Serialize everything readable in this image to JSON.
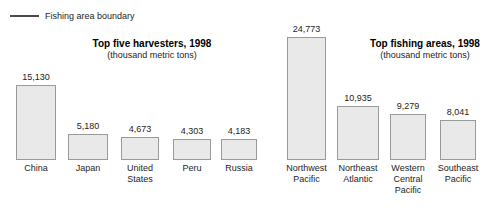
{
  "legend": {
    "icon": "horizontal-line-swatch",
    "label": "Fishing area boundary"
  },
  "panels": [
    {
      "id": "top-five-harvesters",
      "title": "Top five harvesters, 1998",
      "subtitle": "(thousand metric tons)"
    },
    {
      "id": "top-fishing-areas",
      "title": "Top fishing areas, 1998",
      "subtitle": "(thousand metric tons)"
    }
  ],
  "chart_data": [
    {
      "type": "bar",
      "title": "Top five harvesters, 1998",
      "subtitle": "(thousand metric tons)",
      "xlabel": "",
      "ylabel": "thousand metric tons",
      "ylim": [
        0,
        24773
      ],
      "grid": false,
      "legend_position": "top-left",
      "categories": [
        "China",
        "Japan",
        "United States",
        "Peru",
        "Russia"
      ],
      "category_lines": [
        [
          "China"
        ],
        [
          "Japan"
        ],
        [
          "United",
          "States"
        ],
        [
          "Peru"
        ],
        [
          "Russia"
        ]
      ],
      "values": [
        15130,
        5180,
        4673,
        4303,
        4183
      ],
      "value_labels": [
        "15,130",
        "5,180",
        "4,673",
        "4,303",
        "4,183"
      ]
    },
    {
      "type": "bar",
      "title": "Top fishing areas, 1998",
      "subtitle": "(thousand metric tons)",
      "xlabel": "",
      "ylabel": "thousand metric tons",
      "ylim": [
        0,
        24773
      ],
      "grid": false,
      "legend_position": "none",
      "categories": [
        "Northwest Pacific",
        "Northeast Atlantic",
        "Western Central Pacific",
        "Southeast Pacific"
      ],
      "category_lines": [
        [
          "Northwest",
          "Pacific"
        ],
        [
          "Northeast",
          "Atlantic"
        ],
        [
          "Western",
          "Central",
          "Pacific"
        ],
        [
          "Southeast",
          "Pacific"
        ]
      ],
      "values": [
        24773,
        10935,
        9279,
        8041
      ],
      "value_labels": [
        "24,773",
        "10,935",
        "9,279",
        "8,041"
      ]
    }
  ],
  "colors": {
    "bar_fill": "#e9e9e9",
    "bar_border": "#9a9a9a",
    "text": "#1d1d1d",
    "legend_line": "#4a4a4a",
    "background": "#ffffff"
  }
}
